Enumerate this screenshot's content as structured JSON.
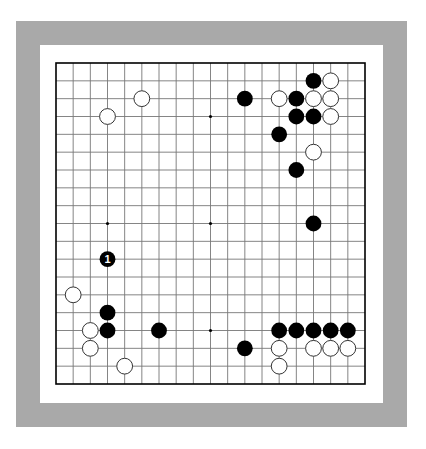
{
  "board": {
    "size": 19,
    "grid": {
      "left": 56,
      "top": 63,
      "right": 365,
      "bottom": 384
    },
    "colors": {
      "frame": "#a9a9a9",
      "paper": "#ffffff",
      "line": "#777777",
      "border_line": "#000000",
      "black_stone": "#000000",
      "white_stone": "#ffffff",
      "white_stone_outline": "#333333",
      "label_on_black": "#ffffff"
    },
    "star_points": [
      [
        3,
        3
      ],
      [
        9,
        3
      ],
      [
        15,
        3
      ],
      [
        3,
        9
      ],
      [
        9,
        9
      ],
      [
        15,
        9
      ],
      [
        3,
        15
      ],
      [
        9,
        15
      ],
      [
        15,
        15
      ]
    ],
    "stones": [
      {
        "color": "black",
        "col": 15,
        "row": 1
      },
      {
        "color": "white",
        "col": 16,
        "row": 1
      },
      {
        "color": "black",
        "col": 11,
        "row": 2
      },
      {
        "color": "white",
        "col": 13,
        "row": 2
      },
      {
        "color": "black",
        "col": 14,
        "row": 2
      },
      {
        "color": "white",
        "col": 15,
        "row": 2
      },
      {
        "color": "white",
        "col": 16,
        "row": 2
      },
      {
        "color": "white",
        "col": 5,
        "row": 2
      },
      {
        "color": "white",
        "col": 3,
        "row": 3
      },
      {
        "color": "black",
        "col": 14,
        "row": 3
      },
      {
        "color": "black",
        "col": 15,
        "row": 3
      },
      {
        "color": "white",
        "col": 16,
        "row": 3
      },
      {
        "color": "black",
        "col": 13,
        "row": 4
      },
      {
        "color": "white",
        "col": 15,
        "row": 5
      },
      {
        "color": "black",
        "col": 14,
        "row": 6
      },
      {
        "color": "black",
        "col": 15,
        "row": 9
      },
      {
        "color": "black",
        "col": 3,
        "row": 11,
        "label": "1"
      },
      {
        "color": "white",
        "col": 1,
        "row": 13
      },
      {
        "color": "black",
        "col": 3,
        "row": 14
      },
      {
        "color": "white",
        "col": 2,
        "row": 15
      },
      {
        "color": "black",
        "col": 3,
        "row": 15
      },
      {
        "color": "black",
        "col": 6,
        "row": 15
      },
      {
        "color": "black",
        "col": 13,
        "row": 15
      },
      {
        "color": "black",
        "col": 14,
        "row": 15
      },
      {
        "color": "black",
        "col": 15,
        "row": 15
      },
      {
        "color": "black",
        "col": 16,
        "row": 15
      },
      {
        "color": "black",
        "col": 17,
        "row": 15
      },
      {
        "color": "white",
        "col": 2,
        "row": 16
      },
      {
        "color": "black",
        "col": 11,
        "row": 16
      },
      {
        "color": "white",
        "col": 13,
        "row": 16
      },
      {
        "color": "white",
        "col": 15,
        "row": 16
      },
      {
        "color": "white",
        "col": 16,
        "row": 16
      },
      {
        "color": "white",
        "col": 17,
        "row": 16
      },
      {
        "color": "white",
        "col": 4,
        "row": 17
      },
      {
        "color": "white",
        "col": 13,
        "row": 17
      }
    ]
  }
}
